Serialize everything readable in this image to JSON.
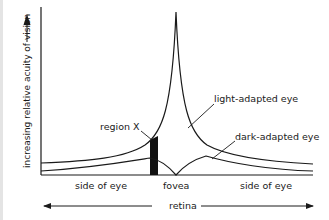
{
  "figure": {
    "y_axis_label": "increasing relative acuity of vision",
    "x_axis_label": "retina",
    "x_labels": {
      "left": "side of eye",
      "center": "fovea",
      "right": "side of eye"
    },
    "annotations": {
      "region_x": "region X",
      "light_adapted": "light-adapted eye",
      "dark_adapted": "dark-adapted eye"
    },
    "colors": {
      "ink": "#1a1a1a",
      "background": "#ffffff",
      "edge_strip": "#e4e4e4"
    }
  }
}
